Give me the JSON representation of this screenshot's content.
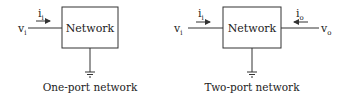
{
  "diagrams": [
    {
      "id": "one-port",
      "box_label": "Network",
      "input_voltage": {
        "base": "v",
        "sub": "i"
      },
      "input_current": {
        "base": "i",
        "sub": "i"
      },
      "caption": "One-port network"
    },
    {
      "id": "two-port",
      "box_label": "Network",
      "input_voltage": {
        "base": "v",
        "sub": "i"
      },
      "input_current": {
        "base": "i",
        "sub": "i"
      },
      "output_voltage": {
        "base": "v",
        "sub": "o"
      },
      "output_current": {
        "base": "i",
        "sub": "o"
      },
      "caption": "Two-port network"
    }
  ],
  "colors": {
    "line": "#333333",
    "text": "#222222",
    "background": "#ffffff"
  }
}
